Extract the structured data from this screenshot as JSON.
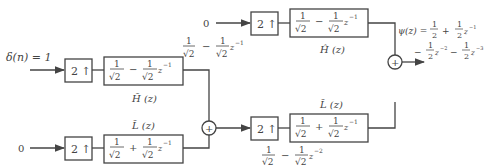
{
  "diagram": {
    "inputs": {
      "top_left": "δ(n) = 1",
      "bottom_left": "0",
      "top_right": "0"
    },
    "upsampler_label": "2 ↑",
    "blocks": {
      "analysis_top": {
        "expr_a": "1",
        "sqrt": "√2",
        "op": "−",
        "expr_b": "1",
        "sqrt_b": "√2",
        "z": "z",
        "exp": "−1",
        "label": "H̃ (z)"
      },
      "analysis_bottom": {
        "expr_a": "1",
        "sqrt": "√2",
        "op": "+",
        "expr_b": "1",
        "sqrt_b": "√2",
        "z": "z",
        "exp": "−1",
        "label": "L̃ (z)"
      },
      "synthesis_top": {
        "expr_a": "1",
        "sqrt": "√2",
        "op": "−",
        "expr_b": "1",
        "sqrt_b": "√2",
        "z": "z",
        "exp": "−1",
        "label": "Ĥ (z)"
      },
      "synthesis_bottom": {
        "expr_a": "1",
        "sqrt": "√2",
        "op": "+",
        "expr_b": "1",
        "sqrt_b": "√2",
        "z": "z",
        "exp": "−1",
        "label": "L̃ (z)"
      }
    },
    "intermediate_top": {
      "a": "1",
      "sa": "√2",
      "op": "−",
      "b": "1",
      "sb": "√2",
      "z": "z",
      "exp": "−1"
    },
    "intermediate_mid": {
      "a": "1",
      "sa": "√2",
      "op": "−",
      "b": "1",
      "sb": "√2",
      "z": "z",
      "exp": "−2"
    },
    "adder_symbol": "+",
    "output": {
      "lhs": "ψ(z) =",
      "t1": "1",
      "t1d": "2",
      "op1": "+",
      "t2": "1",
      "t2d": "2",
      "t2z": "z",
      "t2e": "−1",
      "op2": "−",
      "t3": "1",
      "t3d": "2",
      "t3z": "z",
      "t3e": "−2",
      "op3": "−",
      "t4": "1",
      "t4d": "2",
      "t4z": "z",
      "t4e": "−3"
    }
  }
}
